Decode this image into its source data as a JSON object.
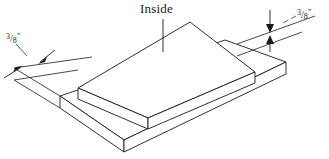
{
  "figure": {
    "title_label": "Inside",
    "line_color": "#1a1a1a",
    "background_color": "#ffffff",
    "text_color": "#1a1a1a"
  },
  "labels": {
    "inside": "Inside",
    "dimension_left": {
      "numerator": "3",
      "slash": "/",
      "denominator": "8",
      "unit": "”",
      "full": "3/8”"
    },
    "dimension_right": {
      "numerator": "3",
      "slash": "/",
      "denominator": "8",
      "unit": "”",
      "full": "3/8”"
    }
  },
  "geometry": {
    "top_slab": {
      "top_face": "255,72 190,22 78,88 148,118",
      "front_left_face": "78,88 148,118 148,129 78,99",
      "front_right_face": "148,118 255,72 255,83 148,129"
    },
    "bottom_slab": {
      "top_face": "286,62 225,40 60,96 124,140",
      "front_left_face": "60,96 124,140 124,152 60,108",
      "front_right_face": "124,140 286,62 286,74 124,152"
    }
  }
}
